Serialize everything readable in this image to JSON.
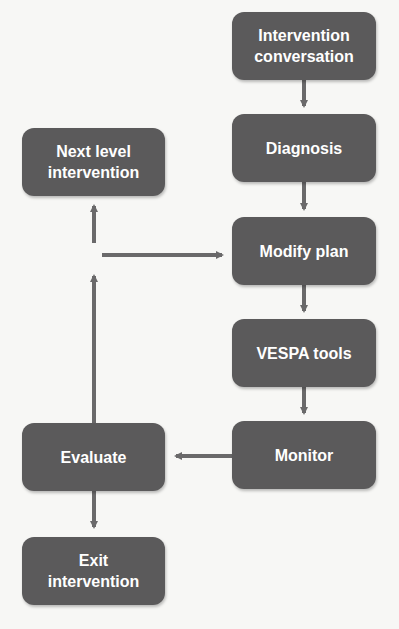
{
  "diagram": {
    "colors": {
      "box_fill": "#5b5a5b",
      "box_text": "#ffffff",
      "arrow": "#6a696a",
      "background": "#f7f7f5"
    },
    "nodes": {
      "intervention_conversation": {
        "line1": "Intervention",
        "line2": "conversation"
      },
      "diagnosis": {
        "label": "Diagnosis"
      },
      "modify_plan": {
        "label": "Modify plan"
      },
      "vespa_tools": {
        "label": "VESPA tools"
      },
      "monitor": {
        "label": "Monitor"
      },
      "evaluate": {
        "label": "Evaluate"
      },
      "next_level": {
        "line1": "Next level",
        "line2": "intervention"
      },
      "exit": {
        "line1": "Exit",
        "line2": "intervention"
      }
    },
    "edges": [
      [
        "Intervention conversation",
        "Diagnosis"
      ],
      [
        "Diagnosis",
        "Modify plan"
      ],
      [
        "Modify plan",
        "VESPA tools"
      ],
      [
        "VESPA tools",
        "Monitor"
      ],
      [
        "Monitor",
        "Evaluate"
      ],
      [
        "Evaluate",
        "Next level intervention"
      ],
      [
        "Evaluate",
        "Modify plan"
      ],
      [
        "Evaluate",
        "Exit intervention"
      ]
    ]
  }
}
